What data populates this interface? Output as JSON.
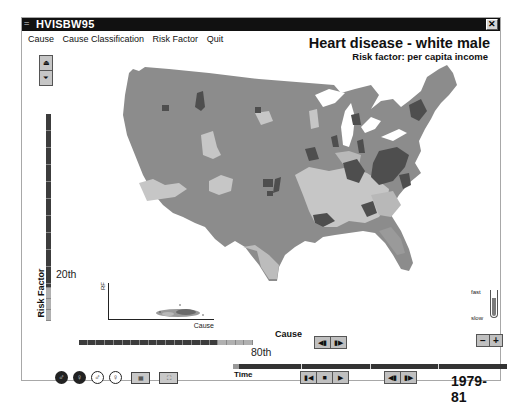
{
  "window": {
    "title": "HVISBW95",
    "close_label": "✕"
  },
  "menu": {
    "items": [
      "Cause",
      "Cause Classification",
      "Risk Factor",
      "Quit"
    ]
  },
  "heading": {
    "title": "Heart disease - white male",
    "subtitle": "Risk factor: per capita income"
  },
  "risk_factor": {
    "label": "Risk Factor",
    "percentile": "20th",
    "up_icon": "⏏",
    "down_icon": "⏷"
  },
  "scatter": {
    "y_label": "RF",
    "x_label": "Cause"
  },
  "cause": {
    "label": "Cause",
    "percentile": "80th",
    "prev_icon": "◀▮",
    "next_icon": "▮▶"
  },
  "speed": {
    "fast_label": "fast",
    "slow_label": "slow",
    "minus_label": "−",
    "plus_label": "+"
  },
  "time": {
    "label": "Time",
    "year": "1979-81",
    "first_icon": "▮◀",
    "stop_icon": "■",
    "play_icon": "▶",
    "step_back_icon": "◀▮",
    "step_fwd_icon": "▮▶"
  },
  "bottom_icons": {
    "male_filled": "♂",
    "female_filled": "♀",
    "male_outline": "♂",
    "female_outline": "♀",
    "map_view": "▦",
    "chart_view": "⛶"
  },
  "colors": {
    "map_base": "#8c8c8c",
    "map_dark": "#4e4e4e",
    "map_light": "#c8c8c8",
    "map_mid": "#a9a9a9",
    "scale_dark": "#3c3c3c",
    "scale_light": "#b0b0b0"
  }
}
